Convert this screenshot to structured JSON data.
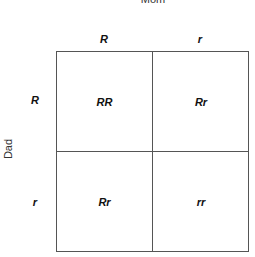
{
  "mom_label": "Mom",
  "dad_label": "Dad",
  "columns": [
    "R",
    "r"
  ],
  "rows": [
    "R",
    "r"
  ],
  "cells": [
    [
      "RR",
      "Rr"
    ],
    [
      "Rr",
      "rr"
    ]
  ]
}
